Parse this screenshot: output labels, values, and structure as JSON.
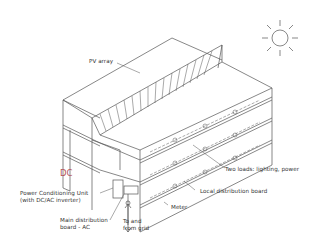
{
  "diagram": {
    "labels": {
      "pv_array": "PV array",
      "dc": "DC",
      "pcu_line1": "Power Conditioning Unit",
      "pcu_line2": "(with DC/AC inverter)",
      "main_board_line1": "Main distribution",
      "main_board_line2": "board - AC",
      "grid_line1": "To and",
      "grid_line2": "from grid",
      "loads": "Two loads: lighting, power",
      "local_board": "Local distribution board",
      "meter": "Meter"
    },
    "icons": {
      "sun": "sun-icon"
    },
    "colors": {
      "line": "#555555",
      "dc_label": "#b5555a",
      "background": "#ffffff"
    }
  }
}
